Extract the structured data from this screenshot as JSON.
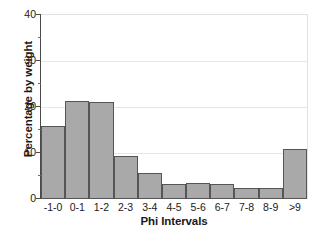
{
  "chart_data": {
    "type": "bar",
    "title": "",
    "xlabel": "Phi Intervals",
    "ylabel": "Percentage by weight",
    "categories": [
      "-1-0",
      "0-1",
      "1-2",
      "2-3",
      "3-4",
      "4-5",
      "5-6",
      "6-7",
      "7-8",
      "8-9",
      ">9"
    ],
    "values": [
      15.8,
      21.3,
      21.1,
      9.4,
      5.7,
      3.3,
      3.5,
      3.3,
      2.4,
      2.5,
      10.8
    ],
    "ylim": [
      0,
      40
    ],
    "yticks": [
      0,
      10,
      20,
      30,
      40
    ],
    "ytick_labels": [
      "0",
      "10",
      "20",
      "30",
      "40"
    ],
    "yminor_ticks": [
      5,
      15,
      25,
      35
    ],
    "grid": "horizontal",
    "legend": "none",
    "bar_fill_color": "#a9a9a9",
    "bar_edge_color": "#555555",
    "axis_color": "#4a4a4a",
    "gridline_color": "#e6e6e6",
    "background_color": "#ffffff",
    "text_color": "#1a1a1a"
  }
}
